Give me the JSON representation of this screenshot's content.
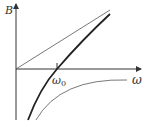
{
  "diagram": {
    "y_axis_label": "B",
    "x_axis_label": "ω",
    "tick_label": "ω",
    "tick_subscript": "0",
    "curves": [
      {
        "name": "straight-line",
        "style": "thin"
      },
      {
        "name": "thick-curve",
        "style": "thick",
        "crosses_x_at": "ω0"
      },
      {
        "name": "lower-curve",
        "style": "thin",
        "asymptote": "ω-axis from below"
      }
    ],
    "colors": {
      "axis": "#333333",
      "thick": "#222222",
      "thin": "#555555"
    }
  }
}
